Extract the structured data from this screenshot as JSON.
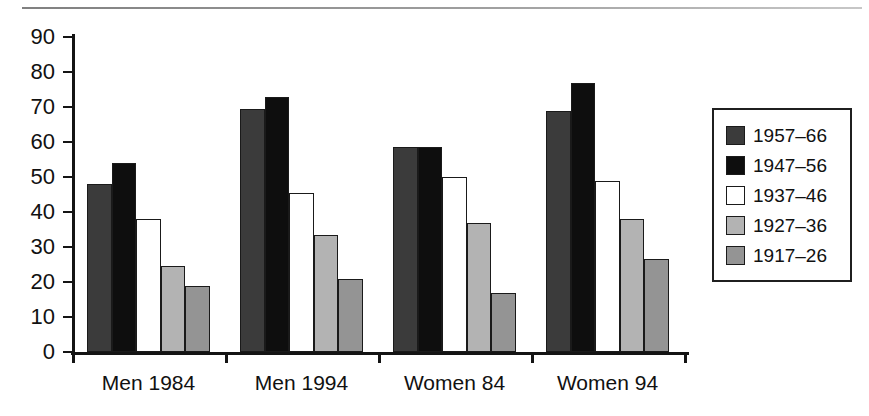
{
  "chart_data": {
    "type": "bar",
    "title": "",
    "subtitle": "",
    "xlabel": "",
    "ylabel": "",
    "categories": [
      "Men 1984",
      "Men 1994",
      "Women 84",
      "Women 94"
    ],
    "series": [
      {
        "name": "1957–66",
        "color": "#3b3b3b",
        "values": [
          48,
          69.5,
          58.5,
          69
        ]
      },
      {
        "name": "1947–56",
        "color": "#0e0e0e",
        "values": [
          54,
          73,
          58.5,
          77
        ]
      },
      {
        "name": "1937–46",
        "color": "#ffffff",
        "values": [
          38,
          45.5,
          50,
          49
        ]
      },
      {
        "name": "1927–36",
        "color": "#b3b3b3",
        "values": [
          24.5,
          33.5,
          37,
          38
        ]
      },
      {
        "name": "1917–26",
        "color": "#949494",
        "values": [
          19,
          21,
          17,
          26.5
        ]
      }
    ],
    "ylim": [
      0,
      90
    ],
    "ytick_labels": [
      "90",
      "80",
      "70",
      "60",
      "50",
      "40",
      "30",
      "20",
      "10",
      "0"
    ],
    "ytick_values": [
      90,
      80,
      70,
      60,
      50,
      40,
      30,
      20,
      10,
      0
    ],
    "grid": false,
    "legend_position": "right",
    "legend_entries": [
      "1957–66",
      "1947–56",
      "1937–46",
      "1927–36",
      "1917–26"
    ],
    "axis_color": "#141414",
    "bar_outline_color": "#1a1a1a",
    "background_color": "#ffffff"
  }
}
